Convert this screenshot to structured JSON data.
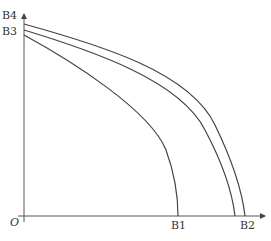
{
  "diagram": {
    "type": "production-possibility-curves",
    "origin_label": "O",
    "y_axis_labels": [
      "B4",
      "B3"
    ],
    "x_axis_labels": [
      "B1",
      "B2"
    ],
    "curves": [
      {
        "name": "inner",
        "from": "B3",
        "to": "B1"
      },
      {
        "name": "middle",
        "from": "B3",
        "to": "B2"
      },
      {
        "name": "outer",
        "from": "B4",
        "to": "B2"
      }
    ],
    "line_color": "#444444"
  }
}
